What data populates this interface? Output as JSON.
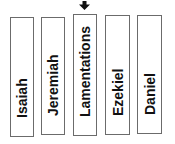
{
  "pointer": {
    "icon": "down-arrow-icon",
    "target": "Lamentations"
  },
  "books": [
    {
      "label": "Isaiah"
    },
    {
      "label": "Jeremiah"
    },
    {
      "label": "Lamentations"
    },
    {
      "label": "Ezekiel"
    },
    {
      "label": "Daniel"
    }
  ],
  "colors": {
    "border": "#6b6b6b",
    "text": "#111111",
    "arrow": "#111111",
    "background": "#ffffff"
  }
}
